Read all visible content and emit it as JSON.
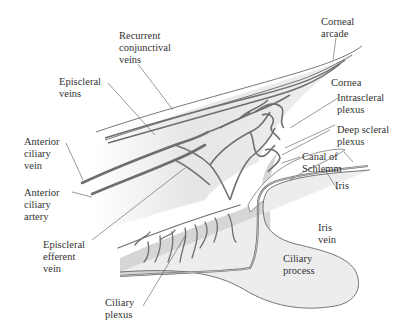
{
  "labels": {
    "recurrent_conjunctival_veins": "Recurrent\nconjunctival\nveins",
    "episcleral_veins": "Episcleral\nveins",
    "corneal_arcade": "Corneal\narcade",
    "cornea": "Cornea",
    "intrascleral_plexus": "Intrascleral\nplexus",
    "deep_scleral_plexus": "Deep scleral\nplexus",
    "canal_of_schlemm": "Canal of\nSchlemm",
    "iris": "Iris",
    "iris_vein": "Iris\nvein",
    "ciliary_process": "Ciliary\nprocess",
    "anterior_ciliary_vein": "Anterior\nciliary\nvein",
    "anterior_ciliary_artery": "Anterior\nciliary\nartery",
    "episcleral_efferent_vein": "Episcleral\nefferent\nvein",
    "ciliary_plexus": "Ciliary\nplexus"
  },
  "colors": {
    "tissue_light": "#ececec",
    "tissue_mid": "#d8d8d8",
    "ciliary_body": "#c9c9c9",
    "vessel": "#6e6e6e",
    "leader": "#555555",
    "text": "#333333"
  }
}
